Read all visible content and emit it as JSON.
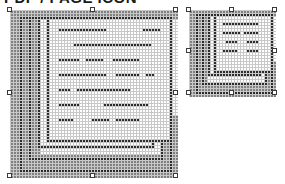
{
  "app": {
    "title_clipped": "PDF / PAGE ICON",
    "canvas_background": "#ffffff"
  },
  "palette": {
    "ink": "#2b2b2b",
    "paper": "#ffffff",
    "shadow": "#808080",
    "gridline": "#c8c8c8",
    "handle_fill": "#ffffff",
    "handle_stroke": "#3a3a3a"
  },
  "objects": [
    {
      "name": "large-page-icon",
      "label": "Large page icon",
      "x": 10,
      "y": 10,
      "cell": 3,
      "cols": 56,
      "rows": 56,
      "selected": true,
      "handle_count": 8,
      "rle": [
        "56.",
        "1.8s46.1s",
        "1.8s1k1.1k44.1s",
        "1.8s1k1.1k1.40k1.1s",
        "1.4s1k3s1k1.1k1.40k1.1s",
        "1.3s1k1.3s1k1.1k1.40k1.1s",
        "1.3s1k1.3s1k1.1k1.7.13k20.4k1.1s",
        "1.3s1k1.3s1k1.1k1.40k1.1s",
        "1.3s1k1.3s1k1.1k1.11.22k7.1s",
        "1.3s1k1.3s1k1.1k1.40k1.1s",
        "1.3s1k1.3s1k1.1k1.7.7k3.5k3.9k6.1s",
        "1.3s1k1.3s1k1.1k1.40k1.1s",
        "1.3s1k1.3s1k1.1k1.7.13k2.8k2.3k4.1s",
        "1.3s1k1.3s1k1.1k1.40k1.1s",
        "1.3s1k1.3s1k1.1k1.7.4k3.16k10.1s",
        "1.3s1k1.3s1k1.1k1.40k1.1s",
        "1.3s1k1.3s1k1.1k1.7.7k7.14k5.1s",
        "1.3s1k1.3s1k1.1k1.40k1.1s",
        "1.3s1k1.3s1k1.1k1.7.5k6.5k1.7k8.1s",
        "1.3s1k1.3s1k1.1k1.40k1.1s",
        "1.3s1k1.3s1k1.1k42.1s",
        "1.3s1k1.3s1k44.1s",
        "1.3s1k1.48s1.1s",
        "1.3s1k52.",
        "1.3s1k52.",
        "56."
      ],
      "handles": [
        {
          "pos": "nw",
          "x": 10,
          "y": 10
        },
        {
          "pos": "n",
          "x": 93,
          "y": 10
        },
        {
          "pos": "ne",
          "x": 176,
          "y": 10
        },
        {
          "pos": "w",
          "x": 10,
          "y": 93
        },
        {
          "pos": "e",
          "x": 176,
          "y": 93
        },
        {
          "pos": "sw",
          "x": 10,
          "y": 176
        },
        {
          "pos": "s",
          "x": 93,
          "y": 176
        },
        {
          "pos": "se",
          "x": 176,
          "y": 176
        }
      ]
    },
    {
      "name": "small-page-icon",
      "label": "Small page icon",
      "x": 189,
      "y": 10,
      "cell": 3,
      "cols": 29,
      "rows": 29,
      "selected": true,
      "handle_count": 8,
      "handles": [
        {
          "pos": "nw",
          "x": 189,
          "y": 10
        },
        {
          "pos": "n",
          "x": 232,
          "y": 10
        },
        {
          "pos": "ne",
          "x": 275,
          "y": 10
        },
        {
          "pos": "w",
          "x": 189,
          "y": 51
        },
        {
          "pos": "e",
          "x": 275,
          "y": 51
        },
        {
          "pos": "sw",
          "x": 189,
          "y": 93
        },
        {
          "pos": "s",
          "x": 232,
          "y": 93
        },
        {
          "pos": "se",
          "x": 275,
          "y": 93
        }
      ]
    }
  ],
  "chart_data": {
    "type": "heatmap",
    "cell_states": [
      "paper",
      "ink",
      "shadow"
    ],
    "legend": [
      {
        "name": "paper",
        "color": "#ffffff"
      },
      {
        "name": "ink",
        "color": "#2b2b2b"
      },
      {
        "name": "shadow",
        "color": "#808080"
      }
    ],
    "grid": true,
    "objects": [
      {
        "name": "large-page-icon",
        "cols": 56,
        "rows": 56,
        "cell_px": 3
      },
      {
        "name": "small-page-icon",
        "cols": 29,
        "rows": 29,
        "cell_px": 3
      }
    ]
  }
}
